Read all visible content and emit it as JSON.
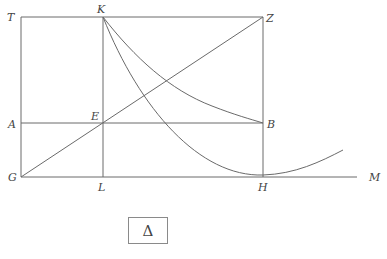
{
  "diagram": {
    "type": "geometric-construction",
    "points": {
      "T": {
        "label": "T",
        "x": 21,
        "y": 17
      },
      "K": {
        "label": "K",
        "x": 103,
        "y": 17
      },
      "Z": {
        "label": "Z",
        "x": 263,
        "y": 17
      },
      "A": {
        "label": "A",
        "x": 21,
        "y": 123
      },
      "E": {
        "label": "E",
        "x": 103,
        "y": 123
      },
      "B": {
        "label": "B",
        "x": 263,
        "y": 123
      },
      "G": {
        "label": "G",
        "x": 21,
        "y": 177
      },
      "L": {
        "label": "L",
        "x": 103,
        "y": 177
      },
      "H": {
        "label": "H",
        "x": 263,
        "y": 177
      },
      "M": {
        "label": "M",
        "x": 357,
        "y": 177
      }
    },
    "segments": [
      "TZ",
      "AB",
      "GM",
      "TG",
      "KL",
      "ZH",
      "GZ"
    ],
    "curves": [
      {
        "name": "hyperbola-KB",
        "from": "K",
        "to": "B"
      },
      {
        "name": "parabola-KH",
        "from": "K",
        "through": "H",
        "to_x": 343
      }
    ],
    "caption_box": {
      "symbol": "Δ"
    }
  }
}
